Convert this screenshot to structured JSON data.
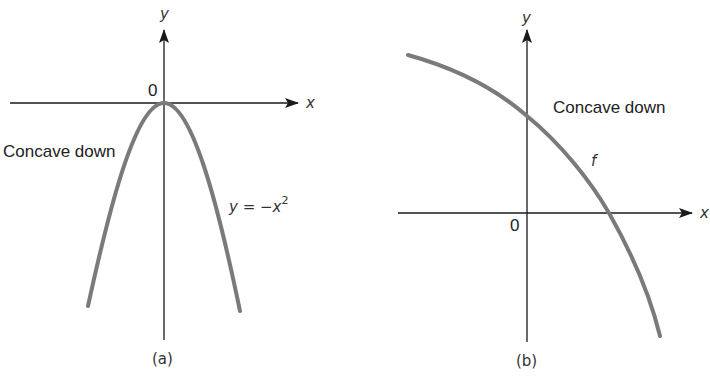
{
  "figure": {
    "colors": {
      "axis": "#1a1a1a",
      "curve": "#7a7a7a",
      "text": "#222222",
      "background": "#ffffff"
    },
    "panel_a": {
      "caption": "(a)",
      "x_axis_label": "x",
      "y_axis_label": "y",
      "origin_label": "0",
      "annotation": "Concave down",
      "equation": "y = −x",
      "equation_exponent": "2",
      "curve": {
        "type": "parabola",
        "function": "y = -x^2",
        "vertex": "origin"
      }
    },
    "panel_b": {
      "caption": "(b)",
      "x_axis_label": "x",
      "y_axis_label": "y",
      "origin_label": "0",
      "annotation": "Concave down",
      "curve_label": "f",
      "curve": {
        "type": "decreasing concave-down curve",
        "crosses": "positive y-axis and positive x-axis"
      }
    }
  }
}
